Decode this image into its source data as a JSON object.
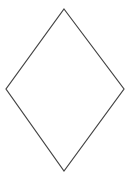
{
  "diagram": {
    "width": 135,
    "height": 177,
    "background": "#ffffff",
    "shapes": [
      {
        "type": "rhombus",
        "name": "diamond-shape",
        "points": [
          [
            64,
            9
          ],
          [
            124,
            89
          ],
          [
            64,
            171
          ],
          [
            6,
            89
          ]
        ],
        "stroke": "#444444",
        "stroke_width": 1.2,
        "fill": "none"
      }
    ]
  }
}
